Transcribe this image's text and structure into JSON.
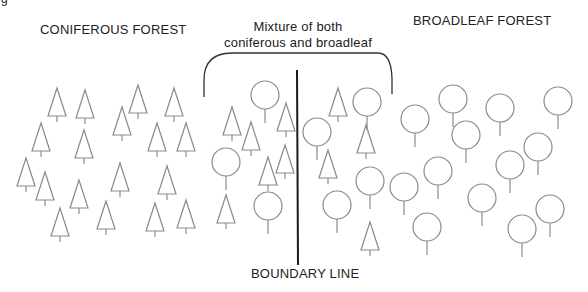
{
  "labels": {
    "corner": "g",
    "coniferous": "CONIFEROUS FOREST",
    "mixture_line1": "Mixture of both",
    "mixture_line2": "coniferous and broadleaf",
    "broadleaf": "BROADLEAF FOREST",
    "boundary": "BOUNDARY LINE"
  },
  "colors": {
    "stroke": "#8a8a8a",
    "boundary": "#1a1a1a",
    "text": "#222222"
  },
  "regions": [
    {
      "name": "coniferous-forest",
      "tree_type": "conifer"
    },
    {
      "name": "mixed-forest",
      "tree_types": [
        "conifer",
        "broadleaf"
      ]
    },
    {
      "name": "broadleaf-forest",
      "tree_type": "broadleaf"
    }
  ],
  "conifers": [
    [
      57,
      88
    ],
    [
      85,
      90
    ],
    [
      138,
      85
    ],
    [
      174,
      88
    ],
    [
      41,
      123
    ],
    [
      84,
      130
    ],
    [
      122,
      107
    ],
    [
      157,
      123
    ],
    [
      186,
      123
    ],
    [
      26,
      158
    ],
    [
      45,
      172
    ],
    [
      79,
      180
    ],
    [
      120,
      163
    ],
    [
      167,
      166
    ],
    [
      60,
      208
    ],
    [
      106,
      201
    ],
    [
      155,
      203
    ],
    [
      186,
      200
    ],
    [
      232,
      107
    ],
    [
      251,
      122
    ],
    [
      286,
      103
    ],
    [
      285,
      145
    ],
    [
      268,
      157
    ],
    [
      226,
      195
    ],
    [
      338,
      88
    ],
    [
      328,
      150
    ],
    [
      366,
      125
    ],
    [
      370,
      222
    ]
  ],
  "broadleaves": [
    [
      265,
      95
    ],
    [
      226,
      162
    ],
    [
      268,
      206
    ],
    [
      317,
      132
    ],
    [
      367,
      102
    ],
    [
      370,
      181
    ],
    [
      337,
      205
    ],
    [
      415,
      119
    ],
    [
      453,
      99
    ],
    [
      500,
      108
    ],
    [
      558,
      101
    ],
    [
      466,
      135
    ],
    [
      538,
      147
    ],
    [
      404,
      187
    ],
    [
      438,
      171
    ],
    [
      482,
      198
    ],
    [
      510,
      165
    ],
    [
      427,
      227
    ],
    [
      522,
      229
    ],
    [
      550,
      209
    ]
  ]
}
